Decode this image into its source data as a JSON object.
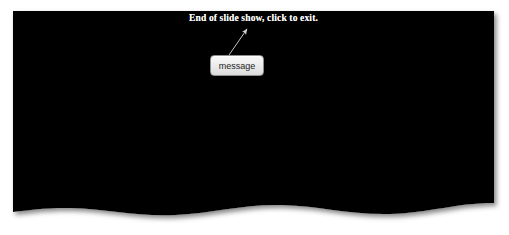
{
  "slide": {
    "background_color": "#000000",
    "exit_message": "End of slide show, click to exit.",
    "exit_message_color": "#ffffff"
  },
  "callout": {
    "label": "message",
    "box_fill_color": "#ededed",
    "box_border_color": "#8d8d8d",
    "label_color": "#1e1e1e",
    "pointer_color": "#c8c8c8",
    "pointer_icon": "arrow-up-left-icon"
  },
  "page": {
    "background_color": "#ffffff",
    "edge_style": "wavy-torn-bottom",
    "shadow_color": "#9a9a9a"
  }
}
